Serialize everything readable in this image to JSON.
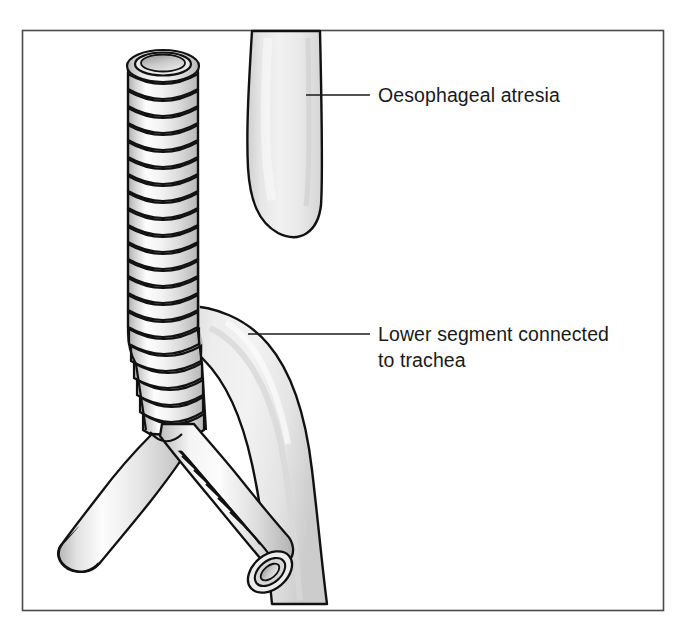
{
  "figure": {
    "frame": {
      "border_color": "#4a4a4a",
      "background_color": "#ffffff"
    },
    "anatomy": {
      "trachea": {
        "name": "trachea",
        "description": "Cartilage-ringed airway running vertically with open lumen at top",
        "ring_count": 24,
        "fill_light": "#ffffff",
        "fill_mid": "#e0e0e0",
        "fill_shadow": "#b4b4b4",
        "outline_color": "#111111"
      },
      "left_bronchus": {
        "name": "left-main-bronchus",
        "description": "Branch descending to the lower left, blunt ending"
      },
      "right_bronchus": {
        "name": "right-main-bronchus",
        "description": "Branch descending to the lower right, open lumen at tip"
      },
      "upper_oesophageal_pouch": {
        "name": "upper-oesophageal-pouch",
        "description": "Blind-ending smooth tube descending from top of frame"
      },
      "lower_oesophageal_segment": {
        "name": "lower-oesophageal-segment-fistula",
        "description": "Smooth tube joining trachea and curving down to bottom of frame"
      }
    },
    "labels": [
      {
        "id": "oesophageal-atresia",
        "lines": [
          "Oesophageal atresia"
        ],
        "text": "Oesophageal atresia",
        "leader": {
          "from_x": 306,
          "from_y": 95,
          "to_x": 370,
          "to_y": 95,
          "color": "#1a1a1a"
        },
        "text_x": 378,
        "text_y": 102
      },
      {
        "id": "lower-segment-connected-to-trachea",
        "lines": [
          "Lower segment connected",
          "to trachea"
        ],
        "text": "Lower segment connected to trachea",
        "leader": {
          "from_x": 248,
          "from_y": 334,
          "to_x": 370,
          "to_y": 334,
          "color": "#1a1a1a"
        },
        "text_x": 378,
        "text_y": 341,
        "line_height": 26
      }
    ]
  }
}
